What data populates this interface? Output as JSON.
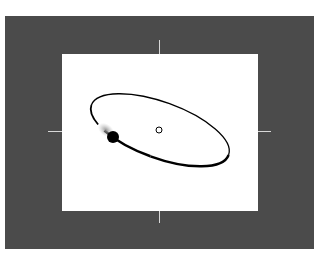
{
  "diagram": {
    "type": "orbit-diagram",
    "colors": {
      "frame": "#4b4b4b",
      "viewport": "#ffffff",
      "orbit": "#000000",
      "ticks": "#d8d8d8",
      "trail": "#9a9a9a"
    },
    "orbit": {
      "center": [
        160,
        130
      ],
      "semi_major": 73,
      "semi_minor": 28,
      "rotation_deg": 20
    },
    "focus": {
      "cx": 159,
      "cy": 130,
      "r": 3,
      "style": "open-circle"
    },
    "body": {
      "cx": 113,
      "cy": 137,
      "r": 6,
      "style": "filled-circle",
      "has_motion_trail": true
    }
  }
}
